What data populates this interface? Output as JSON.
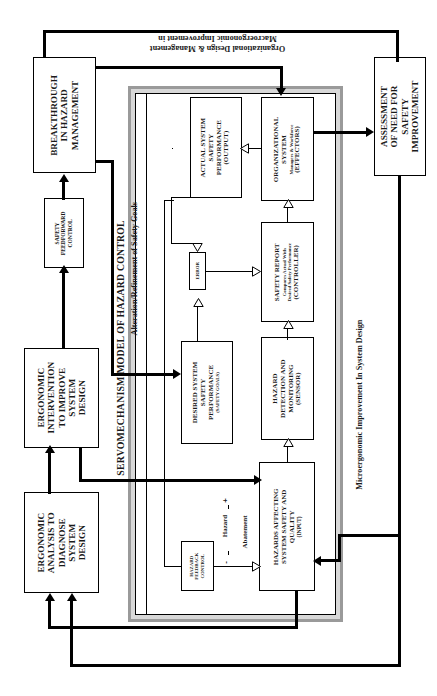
{
  "diagram": {
    "title": "SERVOMECHANISM MODEL OF HAZARD CONTROL",
    "orientation": "rotated-90-ccw",
    "outer_boxes": {
      "breakthrough": "BREAKTHROUGH IN HAZARD MANAGEMENT",
      "safety_feedforward": "SAFETY FEEDFORWARD CONTROL",
      "ergonomic_intervention": "ERGONOMIC INTERVENTION TO IMPROVE SYSTEM DESIGN",
      "ergonomic_analysis": "ERGONOMIC ANALYSIS TO DIAGNOSE SYSTEM DESIGN",
      "assessment": "ASSESSMENT OF NEED FOR SAFETY IMPROVEMENT"
    },
    "inner_boxes": {
      "actual_system": {
        "line1": "ACTUAL SYSTEM",
        "line2": "SAFETY",
        "line3": "PERFORMANCE",
        "line4": "(OUTPUT)"
      },
      "organizational_system": {
        "line1": "ORGANIZATIONAL",
        "line2": "SYSTEM",
        "sub": "Managers & Workforce",
        "line3": "(EFFECTORS)"
      },
      "error": {
        "label": "ERROR"
      },
      "safety_report": {
        "line1": "SAFETY REPORT",
        "sub1": "Compares Actual  With",
        "sub2": "Desired Safety Performance",
        "line2": "(CONTROLLER)"
      },
      "desired_system": {
        "line1": "DESIRED SYSTEM",
        "line2": "SAFETY",
        "line3": "PERFORMANCE",
        "line4": "(SAFETY GOALS)"
      },
      "hazard_detection": {
        "line1": "HAZARD",
        "line2": "DETECTION AND",
        "line3": "MONITORING",
        "line4": "(SENSOR)"
      },
      "hazards_affecting": {
        "line1": "HAZARDS AFFECTING",
        "line2": "SYSTEM SAFETY AND",
        "line3": "QUALITY",
        "line4": "(INPUT)"
      },
      "hazard_feedback": {
        "line1": "HAZARD",
        "line2": "FEEDBACK",
        "line3": "CONTROL"
      }
    },
    "edge_labels": {
      "macroergonomic_1": "Macroergonomic Improvement in",
      "macroergonomic_2": "Organizational Design & Management",
      "alteration": "Alteration/Refinement of Safety Goals",
      "microergonomic": "Microergonomic Improvement In System Design",
      "hazard": "Hazard",
      "abatement": "Abatement",
      "sign_plus": "+",
      "sign_minus": "-"
    },
    "colors": {
      "line": "#000000",
      "panel_shadow_outer": "#9a9a9a",
      "panel_shadow_inner": "#d8d8d8",
      "background": "#ffffff"
    }
  }
}
